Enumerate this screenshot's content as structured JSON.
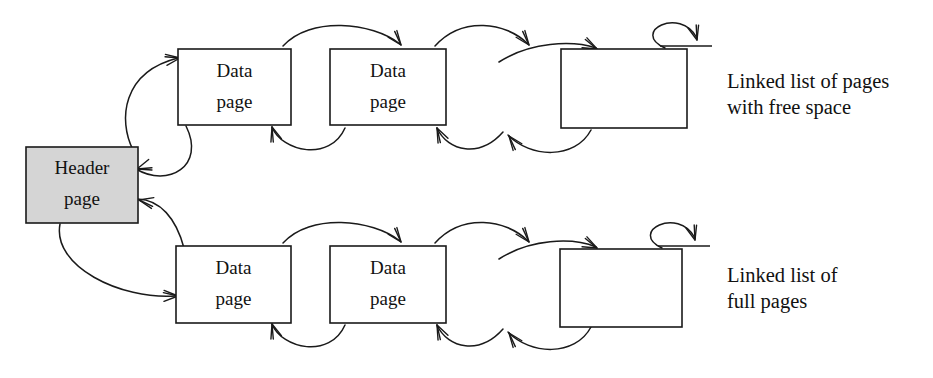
{
  "diagram": {
    "canvas": {
      "width": 933,
      "height": 378
    },
    "colors": {
      "stroke": "#1a1a1a",
      "box_fill": "#ffffff",
      "header_fill": "#d5d5d5",
      "background": "#ffffff",
      "text": "#111111"
    },
    "header_node": {
      "id": "header-page",
      "line1": "Header",
      "line2": "page",
      "shaded": true,
      "x": 26,
      "y": 147,
      "w": 112,
      "h": 76
    },
    "rows": [
      {
        "id": "free-space-row",
        "label_line1": "Linked list of pages",
        "label_line2": "with free space",
        "label_x": 727,
        "label_y1": 88,
        "label_y2": 114,
        "nodes": [
          {
            "id": "free-page-1",
            "line1": "Data",
            "line2": "page",
            "x": 178,
            "y": 49,
            "w": 113,
            "h": 76
          },
          {
            "id": "free-page-2",
            "line1": "Data",
            "line2": "page",
            "x": 330,
            "y": 49,
            "w": 116,
            "h": 76
          },
          {
            "id": "free-page-3",
            "line1": "",
            "line2": "",
            "x": 561,
            "y": 49,
            "w": 126,
            "h": 79
          }
        ]
      },
      {
        "id": "full-pages-row",
        "label_line1": "Linked list of",
        "label_line2": "full pages",
        "label_x": 727,
        "label_y1": 282,
        "label_y2": 308,
        "nodes": [
          {
            "id": "full-page-1",
            "line1": "Data",
            "line2": "page",
            "x": 176,
            "y": 246,
            "w": 115,
            "h": 77
          },
          {
            "id": "full-page-2",
            "line1": "Data",
            "line2": "page",
            "x": 330,
            "y": 246,
            "w": 116,
            "h": 77
          },
          {
            "id": "full-page-3",
            "line1": "",
            "line2": "",
            "x": 560,
            "y": 249,
            "w": 122,
            "h": 78
          }
        ]
      }
    ],
    "connectors": {
      "header_to_free_forward": "M 133,150 C 118,120 122,72 178,58",
      "free_to_header_back": "M 186,126 C 206,166 168,188 136,169",
      "header_to_full_forward": "M 60,224 C 52,266 120,300 176,296",
      "full_to_header_back": "M 184,248 C 176,218 160,200 138,199",
      "free_1_to_2": "M 283,46 C 310,16 372,22 400,44",
      "free_2_to_1_back": "M 345,128 C 330,162 282,152 272,127",
      "free_2_right_out": "M 435,46 C 462,16 506,22 528,44",
      "free_3_left_in": "M 499,62 C 530,42 572,40 596,48",
      "free_2_back_in": "M 503,132 C 480,158 448,152 437,128",
      "free_3_back_out": "M 591,130 C 575,160 530,158 508,135",
      "free_3_self_loop": "M 665,48 C 630,32 680,6 697,38",
      "free_3_stub": "M 660,46 L 712,46",
      "full_1_to_2": "M 283,243 C 310,213 372,219 400,241",
      "full_2_to_1_back": "M 345,325 C 330,359 282,349 272,324",
      "full_2_right_out": "M 435,243 C 462,213 506,219 528,241",
      "full_3_left_in": "M 499,259 C 530,239 572,237 596,247",
      "full_2_back_in": "M 503,329 C 480,355 448,349 437,325",
      "full_3_back_out": "M 591,327 C 575,357 530,355 508,332",
      "full_3_self_loop": "M 662,248 C 628,232 678,206 695,238",
      "full_3_stub": "M 658,246 L 710,246"
    },
    "arrowheads": [
      {
        "id": "ah-header-to-free",
        "x": 180,
        "y": 58,
        "angle": -12
      },
      {
        "id": "ah-free-to-header",
        "x": 137,
        "y": 169,
        "angle": 158
      },
      {
        "id": "ah-header-to-full",
        "x": 178,
        "y": 296,
        "angle": -4
      },
      {
        "id": "ah-full-to-header",
        "x": 139,
        "y": 200,
        "angle": 188
      },
      {
        "id": "ah-free-1-to-2",
        "x": 401,
        "y": 45,
        "angle": 48
      },
      {
        "id": "ah-free-2-to-1",
        "x": 272,
        "y": 127,
        "angle": -112
      },
      {
        "id": "ah-free-2-right",
        "x": 529,
        "y": 45,
        "angle": 48
      },
      {
        "id": "ah-free-3-left",
        "x": 597,
        "y": 49,
        "angle": 22
      },
      {
        "id": "ah-free-2-back",
        "x": 437,
        "y": 128,
        "angle": -120
      },
      {
        "id": "ah-free-3-back",
        "x": 509,
        "y": 136,
        "angle": -132
      },
      {
        "id": "ah-free-3-self",
        "x": 697,
        "y": 40,
        "angle": 70
      },
      {
        "id": "ah-full-1-to-2",
        "x": 401,
        "y": 242,
        "angle": 48
      },
      {
        "id": "ah-full-2-to-1",
        "x": 272,
        "y": 324,
        "angle": -112
      },
      {
        "id": "ah-full-2-right",
        "x": 529,
        "y": 242,
        "angle": 48
      },
      {
        "id": "ah-full-3-left",
        "x": 597,
        "y": 248,
        "angle": 22
      },
      {
        "id": "ah-full-2-back",
        "x": 437,
        "y": 325,
        "angle": -120
      },
      {
        "id": "ah-full-3-back",
        "x": 509,
        "y": 333,
        "angle": -132
      },
      {
        "id": "ah-full-3-self",
        "x": 695,
        "y": 240,
        "angle": 70
      }
    ]
  }
}
